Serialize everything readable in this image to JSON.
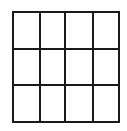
{
  "diagram": {
    "type": "grid",
    "rows": 3,
    "columns": 4,
    "cell_count": 12,
    "frame": {
      "x": 13,
      "y": 12,
      "width": 106,
      "height": 110
    },
    "vertical_lines_x": [
      13,
      40,
      65,
      93,
      119
    ],
    "horizontal_lines_y": [
      12,
      49,
      85,
      122
    ],
    "stroke_color": "#1a1a1a",
    "fill_color": "#ffffff",
    "stroke_width": 2
  }
}
